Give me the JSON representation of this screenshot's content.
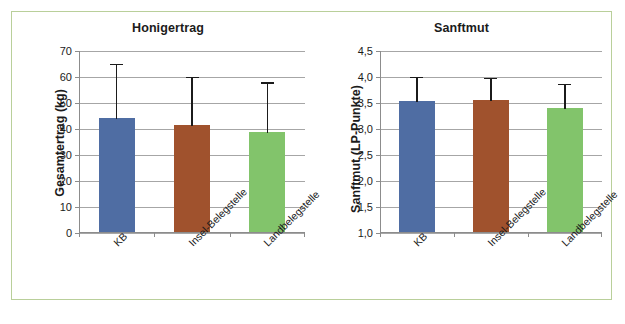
{
  "figure": {
    "border_color": "#b9cf9a",
    "background": "#ffffff"
  },
  "series_colors": {
    "kb": "#4f6da3",
    "insel": "#a0522d",
    "land": "#82c46b"
  },
  "chart_data": [
    {
      "type": "bar",
      "title": "Honigertrag",
      "xlabel": "",
      "ylabel": "Gesamtertrag (kg)",
      "categories": [
        "KB",
        "Insel-Belegstelle",
        "Landbelegstelle"
      ],
      "values": [
        44,
        41,
        38.5
      ],
      "errors_upper": [
        65,
        60,
        58
      ],
      "ylim": [
        0,
        70
      ],
      "yticks": [
        0,
        10,
        20,
        30,
        40,
        50,
        60,
        70
      ],
      "ytick_labels": [
        "0",
        "10",
        "20",
        "30",
        "40",
        "50",
        "60",
        "70"
      ],
      "grid": true,
      "legend": "none",
      "bar_colors": [
        "#4f6da3",
        "#a0522d",
        "#82c46b"
      ]
    },
    {
      "type": "bar",
      "title": "Sanftmut",
      "xlabel": "",
      "ylabel": "Sanftmut (LP-Punkte)",
      "categories": [
        "KB",
        "Insel-Belegstelle",
        "Landbelegstelle"
      ],
      "values": [
        3.52,
        3.53,
        3.39
      ],
      "errors_upper": [
        4.0,
        3.98,
        3.87
      ],
      "ylim": [
        1.0,
        4.5
      ],
      "yticks": [
        1.0,
        1.5,
        2.0,
        2.5,
        3.0,
        3.5,
        4.0,
        4.5
      ],
      "ytick_labels": [
        "1,0",
        "1,5",
        "2,0",
        "2,5",
        "3,0",
        "3,5",
        "4,0",
        "4,5"
      ],
      "grid": true,
      "legend": "none",
      "bar_colors": [
        "#4f6da3",
        "#a0522d",
        "#82c46b"
      ]
    }
  ]
}
